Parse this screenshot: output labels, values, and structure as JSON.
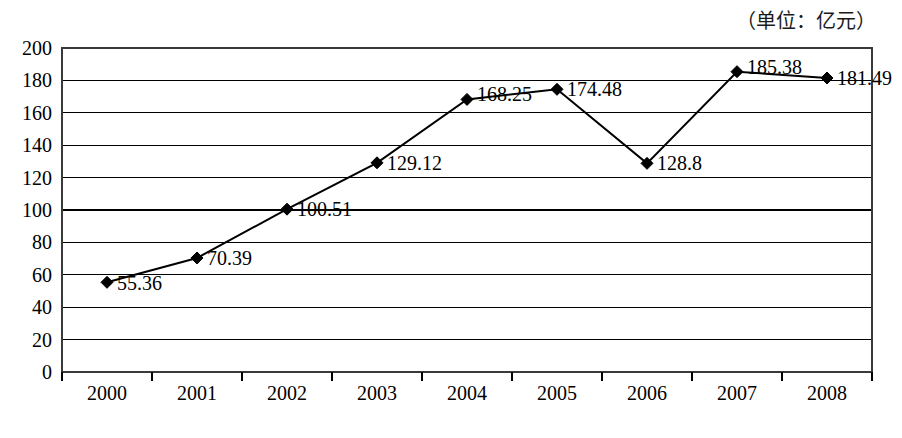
{
  "unit_note": "（单位：亿元）",
  "chart_data": {
    "type": "line",
    "title": "",
    "subtitle": "",
    "xlabel": "",
    "ylabel": "",
    "unit_note": "（单位：亿元）",
    "categories": [
      "2000",
      "2001",
      "2002",
      "2003",
      "2004",
      "2005",
      "2006",
      "2007",
      "2008"
    ],
    "values": [
      55.36,
      70.39,
      100.51,
      129.12,
      168.25,
      174.48,
      128.8,
      185.38,
      181.49
    ],
    "point_labels": [
      "55.36",
      "70.39",
      "100.51",
      "129.12",
      "168.25",
      "174.48",
      "128.8",
      "185.38",
      "181.49"
    ],
    "series": [
      {
        "name": "",
        "values": [
          55.36,
          70.39,
          100.51,
          129.12,
          168.25,
          174.48,
          128.8,
          185.38,
          181.49
        ]
      }
    ],
    "ylim": [
      0,
      200
    ],
    "ytick_step": 20,
    "yticks": [
      "0",
      "20",
      "40",
      "60",
      "80",
      "100",
      "120",
      "140",
      "160",
      "180",
      "200"
    ],
    "grid": true,
    "grid_axis": "y",
    "legend": "none",
    "marker": "diamond",
    "line_color": "#000000",
    "marker_color": "#000000",
    "grid_color": "#000000",
    "border_color": "#3a3a3a",
    "background": "#ffffff"
  }
}
